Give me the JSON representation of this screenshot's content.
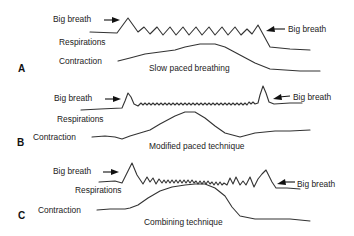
{
  "panels": [
    {
      "letter": "A",
      "title": "Slow paced breathing",
      "labels": {
        "big_breath_left": "Big breath",
        "big_breath_right": "Big breath",
        "respirations": "Respirations",
        "contraction": "Contraction"
      }
    },
    {
      "letter": "B",
      "title": "Modified paced technique",
      "labels": {
        "big_breath_left": "Big breath",
        "big_breath_right": "Big breath",
        "respirations": "Respirations",
        "contraction": "Contraction"
      }
    },
    {
      "letter": "C",
      "title": "Combining technique",
      "labels": {
        "big_breath_left": "Big breath",
        "big_breath_right": "Big breath",
        "respirations": "Respirations",
        "contraction": "Contraction"
      }
    }
  ],
  "colors": {
    "line": "#333333",
    "text": "#222222",
    "background": "#ffffff"
  }
}
